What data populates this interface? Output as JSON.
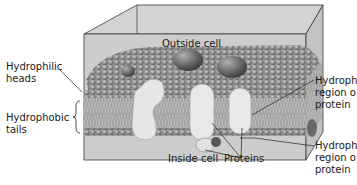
{
  "diagram": {
    "type": "cell-membrane-cross-section",
    "colors": {
      "box_face": "#cfcfcf",
      "box_top": "#d6d6d6",
      "box_edge": "#3a3a3a",
      "head": "#8a8a8a",
      "head_highlight": "#b8b8b8",
      "tail": "#a0a0a0",
      "protein": "#e6e6e6",
      "protein_dark": "#555555",
      "label_text": "#1a1a1a"
    },
    "labels": {
      "outside_cell": "Outside cell",
      "inside_cell": "Inside cell",
      "hydrophilic_heads_1": "Hydrophilic",
      "hydrophilic_heads_2": "heads",
      "hydrophobic_tails_1": "Hydrophobic",
      "hydrophobic_tails_2": "tails",
      "proteins": "Proteins",
      "hydrophobic_region_1": "Hydroph",
      "hydrophobic_region_2": "region o",
      "hydrophobic_region_3": "protein",
      "hydrophilic_region_1": "Hydroph",
      "hydrophilic_region_2": "region o",
      "hydrophilic_region_3": "protein"
    }
  }
}
